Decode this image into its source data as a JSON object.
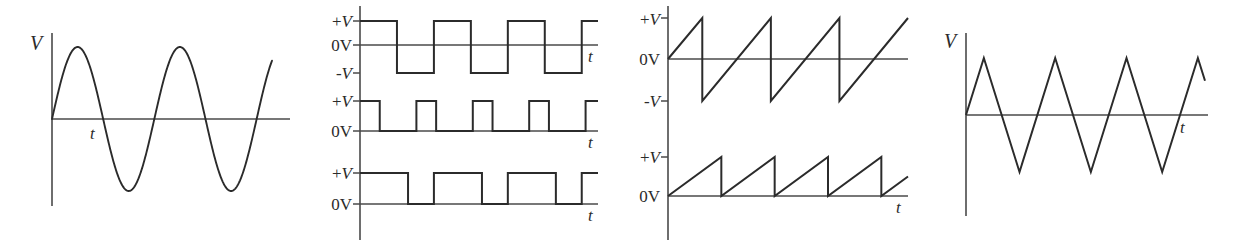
{
  "figure": {
    "background_color": "#ffffff",
    "line_color": "#2b2b2b",
    "axis_color": "#4a4a4a",
    "width": 1238,
    "height": 246
  },
  "panels": [
    {
      "id": "panel-sine",
      "name": "sine-wave-panel",
      "x": 0,
      "width": 310,
      "y_axis_label": "V",
      "t_axis_label": "t",
      "level_labels": [],
      "chart": {
        "type": "line",
        "waveform": "sine",
        "title": "Sine wave",
        "xlabel": "t",
        "ylabel": "V",
        "cycles": 2.15,
        "amplitude": 1.0,
        "offset": 0.0,
        "start_phase": 0.0
      }
    },
    {
      "id": "panel-square",
      "name": "square-wave-panel",
      "x": 310,
      "width": 300,
      "y_axis_label": "",
      "t_axis_label": "t",
      "level_labels": [
        "+V",
        "0V",
        "-V",
        "+V",
        "0V",
        "+V",
        "0V"
      ],
      "chart": {
        "type": "line",
        "waveform": "square-group",
        "title": "Square and pulse waves",
        "xlabel": "t",
        "ylabel": "V",
        "rows": [
          {
            "name": "bipolar-square-wave",
            "levels": [
              "+V",
              "0V",
              "-V"
            ],
            "duty_cycle": 0.5,
            "cycles": 3,
            "high": 1.0,
            "low": -1.0
          },
          {
            "name": "narrow-pulse-train",
            "levels": [
              "+V",
              "0V"
            ],
            "duty_cycle": 0.35,
            "cycles": 4,
            "high": 1.0,
            "low": 0.0
          },
          {
            "name": "wide-pulse-train",
            "levels": [
              "+V",
              "0V"
            ],
            "duty_cycle": 0.65,
            "cycles": 3,
            "high": 1.0,
            "low": 0.0
          }
        ]
      }
    },
    {
      "id": "panel-sawtooth",
      "name": "sawtooth-wave-panel",
      "x": 610,
      "width": 310,
      "y_axis_label": "",
      "t_axis_label": "t",
      "level_labels": [
        "+V",
        "0V",
        "-V",
        "+V",
        "0V"
      ],
      "chart": {
        "type": "line",
        "waveform": "sawtooth-group",
        "title": "Sawtooth waves",
        "xlabel": "t",
        "ylabel": "V",
        "rows": [
          {
            "name": "bipolar-sawtooth-wave",
            "levels": [
              "+V",
              "0V",
              "-V"
            ],
            "cycles": 3.5,
            "high": 1.0,
            "low": -1.0
          },
          {
            "name": "unipolar-sawtooth-wave",
            "levels": [
              "+V",
              "0V"
            ],
            "cycles": 4.5,
            "high": 1.0,
            "low": 0.0
          }
        ]
      }
    },
    {
      "id": "panel-triangle",
      "name": "triangle-wave-panel",
      "x": 920,
      "width": 318,
      "y_axis_label": "V",
      "t_axis_label": "t",
      "level_labels": [],
      "chart": {
        "type": "line",
        "waveform": "triangle",
        "title": "Triangle wave",
        "xlabel": "t",
        "ylabel": "V",
        "cycles": 3.35,
        "amplitude": 1.0,
        "offset": 0.0
      }
    }
  ],
  "chart_data": {
    "type": "line",
    "xlabel": "t",
    "ylabel": "V",
    "grid": false,
    "legend": "none",
    "panel_count": 4,
    "series": [
      {
        "name": "Sine wave",
        "panel": "panel-sine",
        "waveform": "sine",
        "cycles": 2.15,
        "ylim": [
          -1,
          1
        ],
        "yticks": [],
        "ytick_labels": [],
        "axis_labels": {
          "y": "V",
          "x": "t"
        }
      },
      {
        "name": "Bipolar square wave",
        "panel": "panel-square",
        "waveform": "square",
        "cycles": 3,
        "duty_cycle": 0.5,
        "ylim": [
          -1,
          1
        ],
        "yticks": [
          1,
          0,
          -1
        ],
        "ytick_labels": [
          "+V",
          "0V",
          "-V"
        ],
        "axis_labels": {
          "x": "t"
        }
      },
      {
        "name": "Narrow pulse train",
        "panel": "panel-square",
        "waveform": "pulse",
        "cycles": 4,
        "duty_cycle": 0.35,
        "ylim": [
          0,
          1
        ],
        "yticks": [
          1,
          0
        ],
        "ytick_labels": [
          "+V",
          "0V"
        ],
        "axis_labels": {
          "x": "t"
        }
      },
      {
        "name": "Wide pulse train",
        "panel": "panel-square",
        "waveform": "pulse",
        "cycles": 3,
        "duty_cycle": 0.65,
        "ylim": [
          0,
          1
        ],
        "yticks": [
          1,
          0
        ],
        "ytick_labels": [
          "+V",
          "0V"
        ],
        "axis_labels": {
          "x": "t"
        }
      },
      {
        "name": "Bipolar sawtooth wave",
        "panel": "panel-sawtooth",
        "waveform": "sawtooth",
        "cycles": 3.5,
        "ylim": [
          -1,
          1
        ],
        "yticks": [
          1,
          0,
          -1
        ],
        "ytick_labels": [
          "+V",
          "0V",
          "-V"
        ],
        "axis_labels": {
          "x": "t"
        }
      },
      {
        "name": "Unipolar sawtooth wave",
        "panel": "panel-sawtooth",
        "waveform": "sawtooth",
        "cycles": 4.5,
        "ylim": [
          0,
          1
        ],
        "yticks": [
          1,
          0
        ],
        "ytick_labels": [
          "+V",
          "0V"
        ],
        "axis_labels": {
          "x": "t"
        }
      },
      {
        "name": "Triangle wave",
        "panel": "panel-triangle",
        "waveform": "triangle",
        "cycles": 3.35,
        "ylim": [
          -1,
          1
        ],
        "yticks": [],
        "ytick_labels": [],
        "axis_labels": {
          "y": "V",
          "x": "t"
        }
      }
    ]
  },
  "geometry": {
    "sine": {
      "axis_x": 52,
      "axis_top": 33,
      "axis_bottom": 206,
      "baseline_y": 119,
      "baseline_x_end": 290,
      "wave_x_start": 52,
      "wave_x_end": 272,
      "peak_y": 48,
      "trough_y": 192,
      "label_v": {
        "x": 30,
        "y": 50
      },
      "label_t": {
        "x": 90,
        "y": 139
      }
    },
    "square": {
      "axis_x": 360,
      "axis_top": 6,
      "axis_bottom": 240,
      "rows": [
        {
          "high_y": 21,
          "zero_y": 45,
          "low_y": 73,
          "x_start": 360,
          "x_end": 598,
          "baseline_end": 598,
          "label_t": {
            "x": 588,
            "y": 62
          },
          "labels": [
            {
              "text": "+V",
              "x": 352,
              "y": 27
            },
            {
              "text": "0V",
              "x": 352,
              "y": 51
            },
            {
              "text": "-V",
              "x": 352,
              "y": 79
            }
          ],
          "ticks": [
            21,
            45,
            73
          ]
        },
        {
          "high_y": 101,
          "zero_y": 131,
          "x_start": 360,
          "x_end": 598,
          "label_t": {
            "x": 588,
            "y": 148
          },
          "labels": [
            {
              "text": "+V",
              "x": 352,
              "y": 107
            },
            {
              "text": "0V",
              "x": 352,
              "y": 137
            }
          ],
          "ticks": [
            101,
            131
          ]
        },
        {
          "high_y": 173,
          "zero_y": 204,
          "x_start": 360,
          "x_end": 598,
          "label_t": {
            "x": 588,
            "y": 221
          },
          "labels": [
            {
              "text": "+V",
              "x": 352,
              "y": 179
            },
            {
              "text": "0V",
              "x": 352,
              "y": 210
            }
          ],
          "ticks": [
            173,
            204
          ]
        }
      ]
    },
    "sawtooth": {
      "axis_x": 668,
      "axis_top": 6,
      "axis_bottom": 240,
      "rows": [
        {
          "high_y": 18,
          "zero_y": 59,
          "low_y": 101,
          "x_start": 668,
          "x_end": 908,
          "labels": [
            {
              "text": "+V",
              "x": 660,
              "y": 25
            },
            {
              "text": "0V",
              "x": 660,
              "y": 65
            },
            {
              "text": "-V",
              "x": 660,
              "y": 107
            }
          ],
          "ticks": [
            18,
            101
          ]
        },
        {
          "high_y": 157,
          "zero_y": 196,
          "x_start": 668,
          "x_end": 908,
          "label_t": {
            "x": 896,
            "y": 213
          },
          "labels": [
            {
              "text": "+V",
              "x": 660,
              "y": 163
            },
            {
              "text": "0V",
              "x": 660,
              "y": 202
            }
          ],
          "ticks": [
            157
          ]
        }
      ]
    },
    "triangle": {
      "axis_x": 966,
      "axis_top": 33,
      "axis_bottom": 216,
      "baseline_y": 115,
      "baseline_x_end": 1208,
      "wave_x_start": 966,
      "wave_x_end": 1205,
      "peak_y": 58,
      "trough_y": 172,
      "label_v": {
        "x": 944,
        "y": 48
      },
      "label_t": {
        "x": 1180,
        "y": 133
      }
    }
  }
}
